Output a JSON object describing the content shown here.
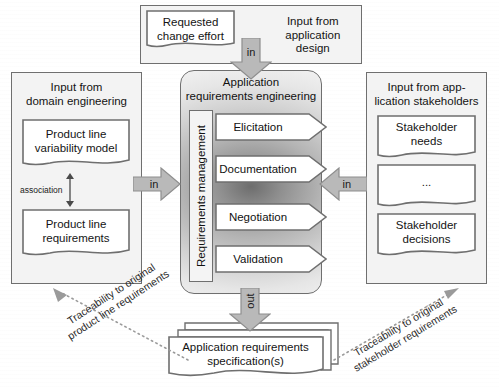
{
  "diagram": {
    "colors": {
      "panel_fill": "#f3f3f3",
      "panel_stroke": "#6f6f6f",
      "arrow_fill": "#b9b9b9",
      "arrow_stroke": "#8a8a8a",
      "doc_fill": "#ffffff",
      "center_dark": "#6d6d6d",
      "center_light": "#efefef",
      "trace_stroke": "#9a9a9a"
    }
  },
  "top_panel": {
    "title": "Input from\napplication design",
    "document": {
      "label": "Requested\nchange effort"
    }
  },
  "left_panel": {
    "title": "Input from\ndomain engineering",
    "documents": [
      {
        "label": "Product line\nvariability model"
      },
      {
        "label": "Product line\nrequirements"
      }
    ],
    "association_label": "association"
  },
  "right_panel": {
    "title": "Input from app-\nlication stakeholders",
    "documents": [
      {
        "label": "Stakeholder\nneeds"
      },
      {
        "label": "..."
      },
      {
        "label": "Stakeholder\ndecisions"
      }
    ]
  },
  "center_panel": {
    "title": "Application\nrequirements engineering",
    "side_label": "Requirements management",
    "activities": [
      {
        "label": "Elicitation"
      },
      {
        "label": "Documentation"
      },
      {
        "label": "Negotiation"
      },
      {
        "label": "Validation"
      }
    ]
  },
  "flow_arrows": {
    "top_in": "in",
    "left_in": "in",
    "right_in": "in",
    "bottom_out": "out"
  },
  "output": {
    "document": {
      "label": "Application requirements\nspecification(s)"
    }
  },
  "traceability": {
    "left": "Traceability to original\nproduct line requirements",
    "right": "Traceability to original\nstakeholder requirements"
  }
}
